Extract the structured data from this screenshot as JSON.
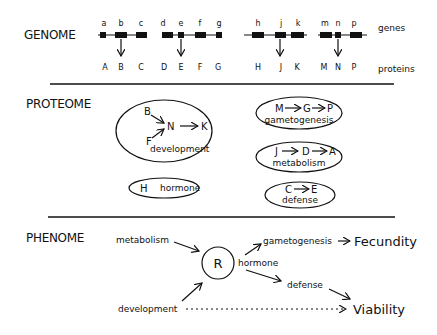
{
  "sections": {
    "genome": "GENOME",
    "proteome": "PROTEOME",
    "phenome": "PHENOME"
  },
  "genome": {
    "genes_label": "genes",
    "proteins_label": "proteins",
    "genes": [
      "a",
      "b",
      "c",
      "d",
      "e",
      "f",
      "g",
      "h",
      "j",
      "k",
      "m",
      "n",
      "p"
    ],
    "proteins": [
      "A",
      "B",
      "C",
      "D",
      "E",
      "F",
      "G",
      "H",
      "J",
      "K",
      "M",
      "N",
      "P"
    ],
    "expressed": [
      "b",
      "e",
      "j",
      "n"
    ]
  },
  "proteome": {
    "development": {
      "inputs": [
        "B",
        "F"
      ],
      "hub": "N",
      "output": "K",
      "label": "development"
    },
    "gametogenesis": {
      "chain": [
        "M",
        "G",
        "P"
      ],
      "label": "gametogenesis"
    },
    "metabolism": {
      "chain": [
        "J",
        "D",
        "A"
      ],
      "label": "metabolism"
    },
    "hormone": {
      "node": "H",
      "label": "hormone"
    },
    "defense": {
      "chain": [
        "C",
        "E"
      ],
      "label": "defense"
    }
  },
  "phenome": {
    "metabolism": "metabolism",
    "development": "development",
    "regulator": "R",
    "hormone": "hormone",
    "gametogenesis": "gametogenesis",
    "defense": "defense",
    "fecundity": "Fecundity",
    "viability": "Viability"
  }
}
